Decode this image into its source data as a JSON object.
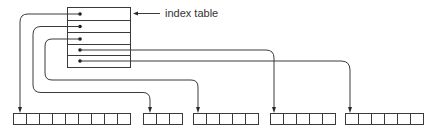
{
  "diagram": {
    "label": "index table",
    "colors": {
      "stroke": "#3a3a3a",
      "background": "#ffffff",
      "text": "#333333"
    },
    "index_table": {
      "x": 67,
      "y": 7,
      "width": 63,
      "rows": 5,
      "row_height": 12
    },
    "blocks": [
      {
        "id": "block-1",
        "x": 13,
        "cells": 9
      },
      {
        "id": "block-2",
        "x": 143,
        "cells": 3
      },
      {
        "id": "block-3",
        "x": 193,
        "cells": 5
      },
      {
        "id": "block-4",
        "x": 270,
        "cells": 5
      },
      {
        "id": "block-5",
        "x": 345,
        "cells": 6
      }
    ],
    "pointers": [
      {
        "from_row": 1,
        "to_block": "block-1"
      },
      {
        "from_row": 2,
        "to_block": "block-2"
      },
      {
        "from_row": 3,
        "to_block": "block-3"
      },
      {
        "from_row": 4,
        "to_block": "block-4"
      },
      {
        "from_row": 5,
        "to_block": "block-5"
      }
    ]
  }
}
